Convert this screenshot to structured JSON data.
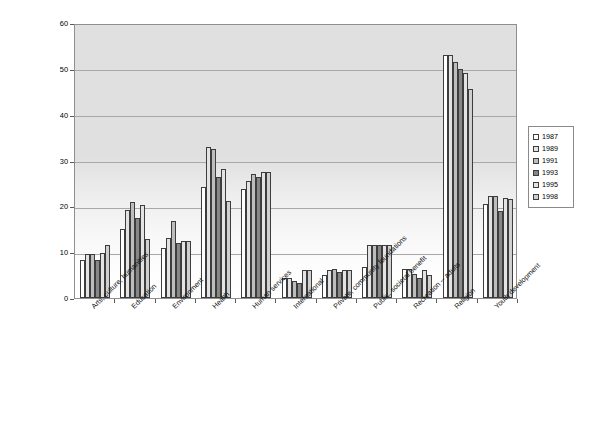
{
  "chart_data": {
    "type": "bar",
    "title": "",
    "xlabel": "",
    "ylabel": "Percentage of Households",
    "ylim": [
      0,
      60
    ],
    "ytick_step": 10,
    "yticks": [
      "0",
      "10",
      "20",
      "30",
      "40",
      "50",
      "60"
    ],
    "grid": true,
    "legend_position": "right",
    "categories": [
      "Arts, culture, humanities",
      "Education",
      "Environment",
      "Health",
      "Human services",
      "International",
      "Private, community foundations",
      "Public, societal benefit",
      "Recreation -- adults",
      "Religion",
      "Youth development"
    ],
    "series": [
      {
        "name": "1987",
        "color": "#ffffff",
        "values": [
          8.2,
          15.0,
          11.0,
          24.3,
          23.8,
          4.3,
          5.0,
          6.7,
          6.3,
          53.0,
          20.5
        ]
      },
      {
        "name": "1989",
        "color": "#e3e3e3",
        "values": [
          9.7,
          19.3,
          13.0,
          33.0,
          25.5,
          4.3,
          6.2,
          11.5,
          6.4,
          53.0,
          22.3
        ]
      },
      {
        "name": "1991",
        "color": "#bdbdbd",
        "values": [
          9.5,
          21.0,
          16.8,
          32.5,
          27.0,
          3.8,
          6.3,
          11.5,
          5.3,
          51.5,
          22.3
        ]
      },
      {
        "name": "1993",
        "color": "#878787",
        "values": [
          8.3,
          17.5,
          12.0,
          26.5,
          26.5,
          3.2,
          5.7,
          11.5,
          4.3,
          50.0,
          19.0
        ]
      },
      {
        "name": "1995",
        "color": "#e3e3e3",
        "values": [
          9.8,
          20.4,
          12.5,
          28.2,
          27.5,
          6.2,
          6.2,
          11.5,
          6.2,
          49.0,
          21.8
        ]
      },
      {
        "name": "1998",
        "color": "#d0d0d0",
        "values": [
          11.5,
          12.8,
          12.5,
          21.2,
          27.5,
          6.2,
          6.2,
          11.5,
          5.0,
          45.5,
          21.5
        ]
      }
    ]
  }
}
